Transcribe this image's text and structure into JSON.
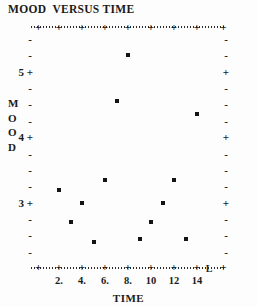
{
  "chart_data": {
    "type": "scatter",
    "title": "MOOD  VERSUS TIME",
    "xlabel": "TIME",
    "ylabel": "MOOD",
    "xlim": [
      0,
      16
    ],
    "ylim": [
      2.0,
      5.7
    ],
    "grid": false,
    "legend": null,
    "x_major_ticks": [
      2,
      4,
      6,
      8,
      10,
      12,
      14
    ],
    "x_tick_labels": [
      "2.",
      "4.",
      "6.",
      "8.",
      "10",
      "12",
      "14"
    ],
    "y_major_ticks": [
      3,
      4,
      5
    ],
    "y_tick_labels": [
      "3",
      "4",
      "5"
    ],
    "x_minor_step": 0.5,
    "y_minor_step": 0.25,
    "marker": "filled-square-dot",
    "points": [
      {
        "x": 2,
        "y": 3.2
      },
      {
        "x": 3,
        "y": 2.7
      },
      {
        "x": 4,
        "y": 3.0
      },
      {
        "x": 5,
        "y": 2.4
      },
      {
        "x": 6,
        "y": 3.35
      },
      {
        "x": 7,
        "y": 4.55
      },
      {
        "x": 8,
        "y": 5.25
      },
      {
        "x": 9,
        "y": 2.45
      },
      {
        "x": 10,
        "y": 2.7
      },
      {
        "x": 11,
        "y": 3.0
      },
      {
        "x": 12,
        "y": 3.35
      },
      {
        "x": 13,
        "y": 2.45
      },
      {
        "x": 14,
        "y": 4.35
      }
    ],
    "axis_style": {
      "line": "dotted",
      "major_tick_glyph": "+",
      "minor_tick_glyph": "-",
      "color": "#1a1a1a"
    }
  },
  "artifacts": {
    "bottom_axis_mark": "L"
  }
}
